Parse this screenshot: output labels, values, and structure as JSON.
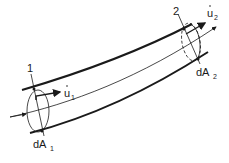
{
  "diagram": {
    "labels": {
      "section1": "1",
      "section2": "2",
      "velocity1": "u",
      "velocity1_sub": "1",
      "velocity2": "u",
      "velocity2_sub": "2",
      "area1": "dA",
      "area1_sub": "1",
      "area2": "dA",
      "area2_sub": "2"
    },
    "colors": {
      "stroke": "#1a1a1a",
      "background": "#ffffff"
    }
  }
}
